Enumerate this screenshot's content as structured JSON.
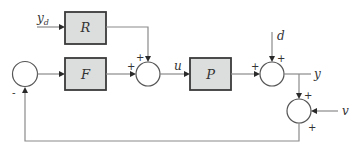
{
  "diagram": {
    "type": "control-system-block-diagram",
    "blocks": [
      {
        "id": "R",
        "label": "R"
      },
      {
        "id": "F",
        "label": "F"
      },
      {
        "id": "P",
        "label": "P"
      }
    ],
    "signals": {
      "reference": {
        "base": "y",
        "sub": "d"
      },
      "control": "u",
      "disturbance": "d",
      "output": "y",
      "noise": "v"
    },
    "summing_junctions": [
      {
        "id": "feedback-sum",
        "signs": [
          "-"
        ]
      },
      {
        "id": "control-sum",
        "signs": [
          "+",
          "+"
        ]
      },
      {
        "id": "disturbance-sum",
        "signs": [
          "+",
          "+"
        ]
      },
      {
        "id": "noise-sum",
        "signs": [
          "+",
          "+"
        ]
      }
    ],
    "colors": {
      "block_fill": "#dcdedd",
      "block_border": "#3a3a3a",
      "wire": "#8a8a8a"
    }
  }
}
